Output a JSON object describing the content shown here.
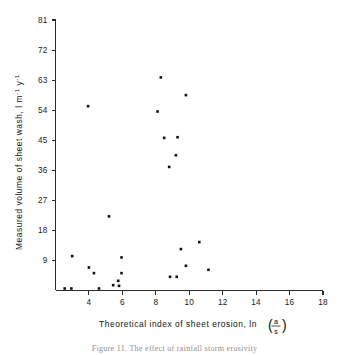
{
  "chart_data": {
    "type": "scatter",
    "title": "",
    "xlabel": "Theoretical index of sheet erosion, ln (a/s)",
    "xlabel_prefix": "Theoretical  index  of  sheet  erosion,  ln",
    "xlabel_fraction_numerator": "a",
    "xlabel_fraction_denominator": "s",
    "ylabel": "Measured volume of sheet wash, l m⁻¹ y⁻¹",
    "ylabel_main": "Measured volume of sheet wash, l m",
    "ylabel_exp1": "-1",
    "ylabel_mid": "y",
    "ylabel_exp2": "-1",
    "xlim": [
      2,
      18
    ],
    "ylim": [
      0,
      81
    ],
    "xticks": [
      4,
      6,
      8,
      10,
      12,
      14,
      16,
      18
    ],
    "yticks": [
      9,
      18,
      27,
      36,
      45,
      54,
      63,
      72,
      81
    ],
    "xtick_labels": [
      "4",
      "6",
      "8",
      "10",
      "12",
      "14",
      "16",
      "18"
    ],
    "ytick_labels": [
      "9",
      "18",
      "27",
      "36",
      "45",
      "54",
      "63",
      "72",
      "81"
    ],
    "grid": false,
    "legend": false,
    "marker": "square",
    "marker_color": "#111111",
    "points": [
      {
        "x": 2.55,
        "y": 0.6
      },
      {
        "x": 2.95,
        "y": 0.6
      },
      {
        "x": 3.0,
        "y": 10.3
      },
      {
        "x": 3.95,
        "y": 55.2
      },
      {
        "x": 4.0,
        "y": 6.9
      },
      {
        "x": 4.3,
        "y": 5.2
      },
      {
        "x": 4.6,
        "y": 0.6
      },
      {
        "x": 5.2,
        "y": 22.2
      },
      {
        "x": 5.45,
        "y": 1.6
      },
      {
        "x": 5.75,
        "y": 2.9
      },
      {
        "x": 5.8,
        "y": 1.4
      },
      {
        "x": 5.95,
        "y": 9.9
      },
      {
        "x": 5.95,
        "y": 5.2
      },
      {
        "x": 8.1,
        "y": 53.6
      },
      {
        "x": 8.3,
        "y": 63.8
      },
      {
        "x": 8.5,
        "y": 45.7
      },
      {
        "x": 8.8,
        "y": 37.0
      },
      {
        "x": 8.85,
        "y": 4.1
      },
      {
        "x": 9.2,
        "y": 40.5
      },
      {
        "x": 9.25,
        "y": 4.1
      },
      {
        "x": 9.3,
        "y": 45.9
      },
      {
        "x": 9.5,
        "y": 12.4
      },
      {
        "x": 9.8,
        "y": 58.5
      },
      {
        "x": 9.8,
        "y": 7.4
      },
      {
        "x": 10.6,
        "y": 14.5
      },
      {
        "x": 11.15,
        "y": 6.2
      }
    ]
  },
  "caption": {
    "text": "Figure 11. The effect of rainfall storm erosivity"
  }
}
